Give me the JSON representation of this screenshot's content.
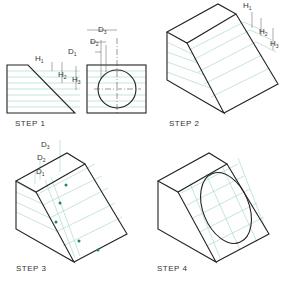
{
  "figure": {
    "steps": [
      {
        "id": 1,
        "label": "STEP 1",
        "dims": [
          "H1",
          "H2",
          "H3",
          "D1",
          "D2",
          "D3"
        ]
      },
      {
        "id": 2,
        "label": "STEP 2",
        "dims": [
          "H1",
          "H2",
          "H3"
        ]
      },
      {
        "id": 3,
        "label": "STEP 3",
        "dims": [
          "D3",
          "D2",
          "D1"
        ]
      },
      {
        "id": 4,
        "label": "STEP 4",
        "dims": []
      }
    ],
    "labels": {
      "H1": "H",
      "H2": "H",
      "H3": "H",
      "D1": "D",
      "D2": "D",
      "D3": "D",
      "sub1": "1",
      "sub2": "2",
      "sub3": "3"
    },
    "colors": {
      "object_line": "#222222",
      "construction_line": "#9fd3c4",
      "point": "#1f8a5a"
    }
  }
}
